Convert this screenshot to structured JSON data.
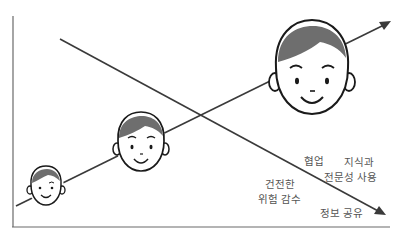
{
  "diagram": {
    "colors": {
      "line": "#3a3a3a",
      "hair": "#6e6e6e",
      "face_outline": "#1a1a1a",
      "text": "#555555"
    },
    "rising_line": "growth",
    "falling_line": "decline",
    "faces": [
      "small-child-face",
      "medium-child-face",
      "large-child-face"
    ],
    "labels": {
      "collaboration": "협업",
      "knowledge_line1": "지식과",
      "knowledge_line2": "전문성 사용",
      "risk_line1": "건전한",
      "risk_line2": "위험 감수",
      "info_sharing": "정보 공유"
    }
  }
}
